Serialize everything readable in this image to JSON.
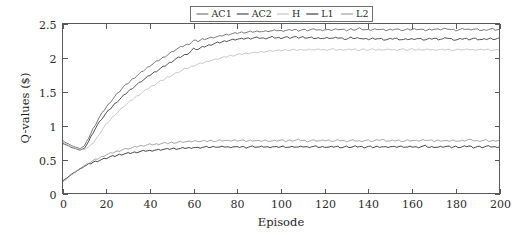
{
  "chart_data": {
    "type": "line",
    "title": "",
    "xlabel": "Episode",
    "ylabel": "Q-values ($)",
    "xlim": [
      0,
      200
    ],
    "ylim": [
      0,
      2.5
    ],
    "xticks": [
      0,
      20,
      40,
      60,
      80,
      100,
      120,
      140,
      160,
      180,
      200
    ],
    "xtick_labels": [
      "0",
      "20",
      "40",
      "60",
      "80",
      "100",
      "120",
      "140",
      "160",
      "180",
      "200"
    ],
    "yticks": [
      0,
      0.5,
      1,
      1.5,
      2,
      2.5
    ],
    "ytick_labels": [
      "0",
      "0.5",
      "1",
      "1.5",
      "2",
      "2.5"
    ],
    "grid": false,
    "legend_position": "top-center-outside",
    "legend_orientation": "horizontal",
    "x": [
      0,
      2,
      4,
      6,
      8,
      10,
      12,
      14,
      16,
      18,
      20,
      22,
      24,
      26,
      28,
      30,
      32,
      34,
      36,
      38,
      40,
      42,
      44,
      46,
      48,
      50,
      52,
      54,
      56,
      58,
      60,
      62,
      64,
      66,
      68,
      70,
      72,
      74,
      76,
      78,
      80,
      82,
      84,
      86,
      88,
      90,
      92,
      94,
      96,
      98,
      100,
      102,
      104,
      106,
      108,
      110,
      112,
      114,
      116,
      118,
      120,
      122,
      124,
      126,
      128,
      130,
      132,
      134,
      136,
      138,
      140,
      142,
      144,
      146,
      148,
      150,
      152,
      154,
      156,
      158,
      160,
      162,
      164,
      166,
      168,
      170,
      172,
      174,
      176,
      178,
      180,
      182,
      184,
      186,
      188,
      190,
      192,
      194,
      196,
      198,
      200
    ],
    "series": [
      {
        "name": "AC1",
        "color": "#6a6a6a",
        "values": [
          0.78,
          0.74,
          0.71,
          0.68,
          0.66,
          0.7,
          0.82,
          0.95,
          1.07,
          1.18,
          1.27,
          1.35,
          1.43,
          1.5,
          1.57,
          1.62,
          1.68,
          1.73,
          1.78,
          1.83,
          1.88,
          1.92,
          1.96,
          2.0,
          2.04,
          2.08,
          2.12,
          2.15,
          2.18,
          2.2,
          2.25,
          2.24,
          2.27,
          2.28,
          2.29,
          2.3,
          2.31,
          2.33,
          2.34,
          2.35,
          2.36,
          2.37,
          2.37,
          2.38,
          2.38,
          2.39,
          2.38,
          2.39,
          2.39,
          2.4,
          2.39,
          2.4,
          2.4,
          2.41,
          2.4,
          2.41,
          2.4,
          2.41,
          2.41,
          2.4,
          2.41,
          2.4,
          2.41,
          2.42,
          2.41,
          2.4,
          2.42,
          2.41,
          2.43,
          2.41,
          2.4,
          2.41,
          2.42,
          2.41,
          2.4,
          2.41,
          2.42,
          2.41,
          2.4,
          2.41,
          2.41,
          2.42,
          2.41,
          2.4,
          2.41,
          2.42,
          2.41,
          2.42,
          2.43,
          2.41,
          2.4,
          2.41,
          2.42,
          2.41,
          2.42,
          2.41,
          2.4,
          2.41,
          2.42,
          2.41,
          2.41
        ]
      },
      {
        "name": "AC2",
        "color": "#3d3d3d",
        "values": [
          0.74,
          0.71,
          0.68,
          0.66,
          0.64,
          0.66,
          0.77,
          0.9,
          1.01,
          1.1,
          1.18,
          1.25,
          1.32,
          1.38,
          1.44,
          1.5,
          1.55,
          1.6,
          1.65,
          1.69,
          1.74,
          1.78,
          1.82,
          1.86,
          1.9,
          1.94,
          1.98,
          2.01,
          2.04,
          2.07,
          2.13,
          2.12,
          2.15,
          2.17,
          2.19,
          2.21,
          2.22,
          2.24,
          2.25,
          2.26,
          2.27,
          2.27,
          2.28,
          2.28,
          2.29,
          2.29,
          2.28,
          2.29,
          2.3,
          2.29,
          2.29,
          2.3,
          2.29,
          2.3,
          2.29,
          2.3,
          2.29,
          2.29,
          2.28,
          2.29,
          2.28,
          2.29,
          2.28,
          2.29,
          2.28,
          2.27,
          2.29,
          2.28,
          2.29,
          2.27,
          2.27,
          2.28,
          2.28,
          2.27,
          2.26,
          2.27,
          2.28,
          2.27,
          2.26,
          2.27,
          2.27,
          2.28,
          2.27,
          2.26,
          2.27,
          2.28,
          2.27,
          2.27,
          2.29,
          2.27,
          2.26,
          2.27,
          2.28,
          2.27,
          2.28,
          2.27,
          2.26,
          2.27,
          2.28,
          2.27,
          2.28
        ]
      },
      {
        "name": "H",
        "color": "#c2c2c2",
        "values": [
          0.76,
          0.72,
          0.69,
          0.67,
          0.65,
          0.65,
          0.68,
          0.74,
          0.83,
          0.93,
          1.02,
          1.09,
          1.16,
          1.22,
          1.28,
          1.33,
          1.38,
          1.43,
          1.47,
          1.52,
          1.56,
          1.6,
          1.64,
          1.67,
          1.71,
          1.74,
          1.77,
          1.8,
          1.83,
          1.85,
          1.88,
          1.9,
          1.92,
          1.94,
          1.96,
          1.97,
          1.99,
          2.0,
          2.02,
          2.03,
          2.04,
          2.05,
          2.06,
          2.07,
          2.07,
          2.08,
          2.09,
          2.09,
          2.1,
          2.1,
          2.1,
          2.11,
          2.11,
          2.11,
          2.11,
          2.12,
          2.11,
          2.12,
          2.11,
          2.12,
          2.11,
          2.12,
          2.12,
          2.11,
          2.12,
          2.11,
          2.12,
          2.12,
          2.11,
          2.12,
          2.11,
          2.12,
          2.11,
          2.12,
          2.11,
          2.12,
          2.11,
          2.12,
          2.12,
          2.11,
          2.12,
          2.11,
          2.12,
          2.11,
          2.12,
          2.11,
          2.12,
          2.11,
          2.12,
          2.11,
          2.11,
          2.12,
          2.11,
          2.12,
          2.11,
          2.12,
          2.11,
          2.12,
          2.11,
          2.11,
          2.11
        ]
      },
      {
        "name": "L1",
        "color": "#2f2f2f",
        "values": [
          0.18,
          0.23,
          0.28,
          0.32,
          0.36,
          0.4,
          0.43,
          0.46,
          0.48,
          0.5,
          0.52,
          0.54,
          0.55,
          0.57,
          0.58,
          0.59,
          0.6,
          0.61,
          0.62,
          0.63,
          0.63,
          0.64,
          0.64,
          0.65,
          0.65,
          0.66,
          0.66,
          0.66,
          0.67,
          0.67,
          0.68,
          0.67,
          0.68,
          0.68,
          0.68,
          0.69,
          0.68,
          0.69,
          0.68,
          0.69,
          0.68,
          0.69,
          0.68,
          0.69,
          0.69,
          0.68,
          0.69,
          0.68,
          0.69,
          0.68,
          0.69,
          0.69,
          0.68,
          0.69,
          0.68,
          0.69,
          0.68,
          0.69,
          0.69,
          0.68,
          0.69,
          0.68,
          0.69,
          0.69,
          0.68,
          0.69,
          0.68,
          0.69,
          0.69,
          0.68,
          0.69,
          0.68,
          0.69,
          0.69,
          0.68,
          0.69,
          0.68,
          0.69,
          0.69,
          0.68,
          0.69,
          0.68,
          0.69,
          0.7,
          0.68,
          0.69,
          0.68,
          0.69,
          0.69,
          0.68,
          0.69,
          0.68,
          0.69,
          0.7,
          0.68,
          0.69,
          0.68,
          0.69,
          0.69,
          0.68,
          0.69
        ]
      },
      {
        "name": "L2",
        "color": "#9a9a9a",
        "values": [
          0.17,
          0.22,
          0.27,
          0.32,
          0.37,
          0.41,
          0.45,
          0.48,
          0.51,
          0.54,
          0.57,
          0.59,
          0.61,
          0.63,
          0.65,
          0.66,
          0.67,
          0.69,
          0.7,
          0.71,
          0.72,
          0.72,
          0.73,
          0.74,
          0.74,
          0.75,
          0.75,
          0.76,
          0.76,
          0.76,
          0.77,
          0.77,
          0.77,
          0.77,
          0.78,
          0.77,
          0.78,
          0.78,
          0.77,
          0.78,
          0.78,
          0.78,
          0.77,
          0.78,
          0.78,
          0.77,
          0.78,
          0.78,
          0.77,
          0.78,
          0.78,
          0.77,
          0.78,
          0.78,
          0.79,
          0.78,
          0.77,
          0.78,
          0.78,
          0.77,
          0.78,
          0.78,
          0.77,
          0.78,
          0.78,
          0.77,
          0.78,
          0.78,
          0.77,
          0.78,
          0.78,
          0.77,
          0.78,
          0.79,
          0.78,
          0.77,
          0.78,
          0.78,
          0.77,
          0.78,
          0.78,
          0.77,
          0.78,
          0.79,
          0.78,
          0.77,
          0.78,
          0.78,
          0.77,
          0.78,
          0.78,
          0.77,
          0.78,
          0.79,
          0.78,
          0.77,
          0.78,
          0.78,
          0.77,
          0.78,
          0.78
        ]
      }
    ],
    "legend": [
      {
        "label": "AC1",
        "color": "#6a6a6a"
      },
      {
        "label": "AC2",
        "color": "#3d3d3d"
      },
      {
        "label": "H",
        "color": "#c2c2c2"
      },
      {
        "label": "L1",
        "color": "#2f2f2f"
      },
      {
        "label": "L2",
        "color": "#9a9a9a"
      }
    ]
  }
}
